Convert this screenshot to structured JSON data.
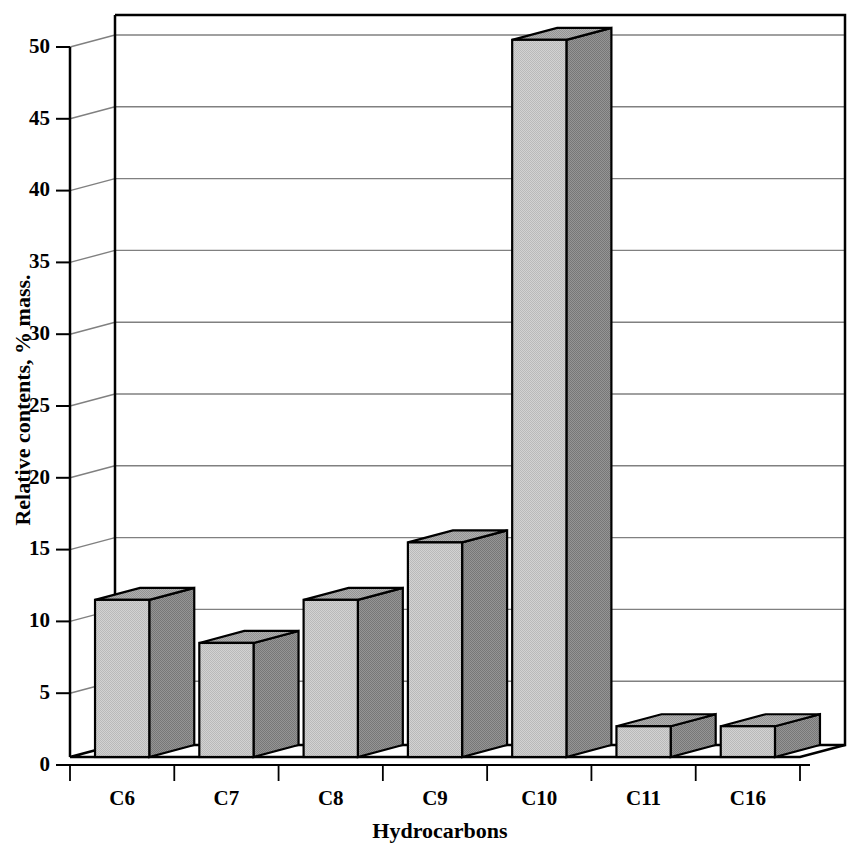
{
  "chart_data": {
    "type": "bar",
    "title": "",
    "subtitle": "",
    "xlabel": "Hydrocarbons",
    "ylabel": "Relative contents, % mass.",
    "categories": [
      "C6",
      "C7",
      "C8",
      "C9",
      "C10",
      "C11",
      "C16"
    ],
    "values": [
      11.5,
      8.5,
      11.5,
      15.5,
      50.5,
      2.7,
      2.7
    ],
    "ylim": [
      0,
      50
    ],
    "yticks": [
      0,
      5,
      10,
      15,
      20,
      25,
      30,
      35,
      40,
      45,
      50
    ],
    "ytick_labels": [
      "0",
      "5",
      "10",
      "15",
      "20",
      "25",
      "30",
      "35",
      "40",
      "45",
      "50"
    ],
    "grid": true,
    "grid_axis": "y",
    "legend": false,
    "legend_position": "none",
    "style": "3d-bar",
    "series": [
      {
        "name": "Relative contents",
        "values": [
          11.5,
          8.5,
          11.5,
          15.5,
          50.5,
          2.7,
          2.7
        ]
      }
    ],
    "colors": {
      "bar_front": "#c9c9c9",
      "bar_side": "#8a8a8a",
      "bar_top": "#a8a8a8",
      "bar_outline": "#000000",
      "grid_line": "#808080",
      "axis_line": "#000000",
      "background": "#ffffff",
      "wall": "#ffffff",
      "floor": "#ffffff"
    }
  },
  "axes": {
    "y_title": "Relative contents, % mass.",
    "x_title": "Hydrocarbons"
  }
}
